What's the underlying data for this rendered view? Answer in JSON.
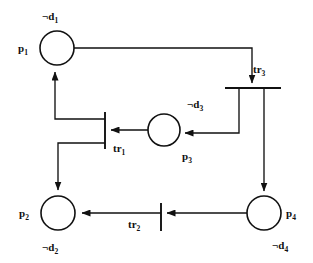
{
  "diagram": {
    "type": "petri-net",
    "background_color": "#ffffff",
    "stroke_color": "#111111",
    "places": [
      {
        "id": "p1",
        "name_base": "p",
        "name_sub": "1",
        "label": "p1",
        "annotation_base": "¬d",
        "annotation_sub": "1",
        "annotation": "¬d1",
        "cx": 57,
        "cy": 48,
        "r": 17
      },
      {
        "id": "p2",
        "name_base": "p",
        "name_sub": "2",
        "label": "p2",
        "annotation_base": "¬d",
        "annotation_sub": "2",
        "annotation": "¬d2",
        "cx": 58,
        "cy": 213,
        "r": 17
      },
      {
        "id": "p3",
        "name_base": "p",
        "name_sub": "3",
        "label": "p3",
        "annotation_base": "¬d",
        "annotation_sub": "3",
        "annotation": "¬d3",
        "cx": 164,
        "cy": 130,
        "r": 16
      },
      {
        "id": "p4",
        "name_base": "p",
        "name_sub": "4",
        "label": "p4",
        "annotation_base": "¬d",
        "annotation_sub": "4",
        "annotation": "¬d4",
        "cx": 264,
        "cy": 213,
        "r": 17
      }
    ],
    "transitions": [
      {
        "id": "tr1",
        "name_base": "tr",
        "name_sub": "1",
        "label": "tr1",
        "orientation": "vertical",
        "x": 105,
        "y1": 112,
        "y2": 149
      },
      {
        "id": "tr2",
        "name_base": "tr",
        "name_sub": "2",
        "label": "tr2",
        "orientation": "vertical",
        "x": 161,
        "y1": 203,
        "y2": 231
      },
      {
        "id": "tr3",
        "name_base": "tr",
        "name_sub": "3",
        "label": "tr3",
        "orientation": "horizontal",
        "y": 88,
        "x1": 225,
        "x2": 281
      }
    ],
    "arcs": [
      {
        "id": "arc-p1-to-tr3",
        "from": "p1",
        "to": "tr3"
      },
      {
        "id": "arc-tr3-to-p3",
        "from": "tr3",
        "to": "p3"
      },
      {
        "id": "arc-tr3-to-p4",
        "from": "tr3",
        "to": "p4"
      },
      {
        "id": "arc-p3-to-tr1",
        "from": "p3",
        "to": "tr1"
      },
      {
        "id": "arc-tr1-to-p1",
        "from": "tr1",
        "to": "p1"
      },
      {
        "id": "arc-tr1-to-p2",
        "from": "tr1",
        "to": "p2"
      },
      {
        "id": "arc-p4-to-tr2",
        "from": "p4",
        "to": "tr2"
      },
      {
        "id": "arc-tr2-to-p2",
        "from": "tr2",
        "to": "p2"
      }
    ]
  },
  "labels": {
    "p1_name_base": "p",
    "p1_name_sub": "1",
    "p1_annot_base": "¬d",
    "p1_annot_sub": "1",
    "p2_name_base": "p",
    "p2_name_sub": "2",
    "p2_annot_base": "¬d",
    "p2_annot_sub": "2",
    "p3_name_base": "p",
    "p3_name_sub": "3",
    "p3_annot_base": "¬d",
    "p3_annot_sub": "3",
    "p4_name_base": "p",
    "p4_name_sub": "4",
    "p4_annot_base": "¬d",
    "p4_annot_sub": "4",
    "tr1_base": "tr",
    "tr1_sub": "1",
    "tr2_base": "tr",
    "tr2_sub": "2",
    "tr3_base": "tr",
    "tr3_sub": "3"
  }
}
